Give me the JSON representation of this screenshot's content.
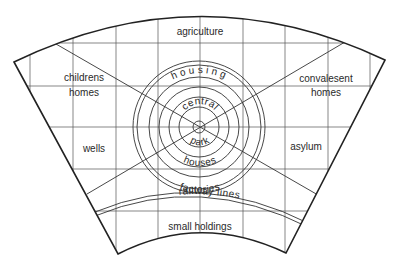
{
  "diagram": {
    "title": "",
    "zones": {
      "agriculture": "agriculture",
      "childrens_homes_line1": "childrens",
      "childrens_homes_line2": "homes",
      "convalesent_homes_line1": "convalesent",
      "convalesent_homes_line2": "homes",
      "wells": "wells",
      "asylum": "asylum",
      "small_holdings": "small holdings",
      "housing": "housing",
      "central_park_top": "central",
      "central_park_bottom": "park",
      "houses": "houses",
      "factories": "factories",
      "railway_lines": "railway lines"
    },
    "colors": {
      "background": "#ffffff",
      "line": "#333333",
      "text": "#2a2a2a"
    }
  }
}
